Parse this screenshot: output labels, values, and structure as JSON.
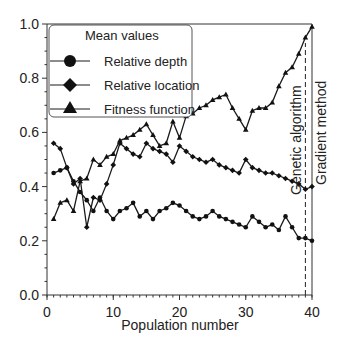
{
  "chart_data": {
    "type": "line",
    "title": "",
    "xlabel": "Population number",
    "ylabel": "",
    "xlim": [
      0,
      40
    ],
    "ylim": [
      0.0,
      1.0
    ],
    "x_ticks": [
      "0",
      "10",
      "20",
      "30",
      "40"
    ],
    "y_ticks": [
      "0.0",
      "0.2",
      "0.4",
      "0.6",
      "0.8",
      "1.0"
    ],
    "grid": false,
    "legend": {
      "title": "Mean values",
      "position": "upper-left",
      "entries": [
        "Relative depth",
        "Relative location",
        "Fitness function"
      ]
    },
    "x": [
      1,
      2,
      3,
      4,
      5,
      6,
      7,
      8,
      9,
      10,
      11,
      12,
      13,
      14,
      15,
      16,
      17,
      18,
      19,
      20,
      21,
      22,
      23,
      24,
      25,
      26,
      27,
      28,
      29,
      30,
      31,
      32,
      33,
      34,
      35,
      36,
      37,
      38,
      39,
      40
    ],
    "series": [
      {
        "name": "Relative depth",
        "marker": "circle",
        "values": [
          0.45,
          0.46,
          0.47,
          0.42,
          0.38,
          0.35,
          0.31,
          0.36,
          0.31,
          0.28,
          0.31,
          0.32,
          0.34,
          0.29,
          0.31,
          0.28,
          0.31,
          0.32,
          0.34,
          0.33,
          0.31,
          0.29,
          0.28,
          0.29,
          0.31,
          0.29,
          0.28,
          0.27,
          0.26,
          0.25,
          0.29,
          0.27,
          0.25,
          0.26,
          0.24,
          0.29,
          0.25,
          0.21,
          0.21,
          0.2
        ]
      },
      {
        "name": "Relative location",
        "marker": "diamond",
        "values": [
          0.56,
          0.54,
          0.47,
          0.41,
          0.43,
          0.25,
          0.36,
          0.35,
          0.41,
          0.48,
          0.56,
          0.54,
          0.52,
          0.51,
          0.56,
          0.54,
          0.53,
          0.52,
          0.49,
          0.55,
          0.53,
          0.51,
          0.5,
          0.49,
          0.5,
          0.48,
          0.47,
          0.46,
          0.45,
          0.5,
          0.47,
          0.46,
          0.45,
          0.45,
          0.44,
          0.43,
          0.42,
          0.41,
          0.39,
          0.4
        ]
      },
      {
        "name": "Fitness function",
        "marker": "triangle",
        "values": [
          0.28,
          0.34,
          0.35,
          0.31,
          0.42,
          0.43,
          0.5,
          0.48,
          0.51,
          0.52,
          0.57,
          0.58,
          0.59,
          0.61,
          0.63,
          0.59,
          0.55,
          0.56,
          0.64,
          0.58,
          0.66,
          0.67,
          0.69,
          0.7,
          0.72,
          0.73,
          0.74,
          0.69,
          0.65,
          0.61,
          0.68,
          0.69,
          0.69,
          0.71,
          0.77,
          0.82,
          0.84,
          0.89,
          0.95,
          0.99
        ]
      }
    ],
    "annotations": [
      {
        "text": "Genetic algorithm",
        "x": 39,
        "orientation": "vertical",
        "line": "dashed",
        "line_top": 0.93
      },
      {
        "text": "Gradient method",
        "x": 40,
        "orientation": "vertical"
      }
    ]
  },
  "labels": {
    "xlabel": "Population number",
    "legend_title": "Mean values",
    "legend_depth": "Relative depth",
    "legend_location": "Relative location",
    "legend_fitness": "Fitness function",
    "annotation_ga": "Genetic algorithm",
    "annotation_gm": "Gradient method"
  },
  "colors": {
    "line": "#1a1a1a",
    "axis": "#333333",
    "text": "#222222"
  }
}
